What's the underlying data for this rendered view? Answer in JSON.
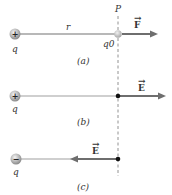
{
  "figure": {
    "point_label": "P",
    "panels": [
      {
        "id": "a",
        "caption": "(a)",
        "source_charge": {
          "sign": "+",
          "label": "q"
        },
        "distance_label": "r",
        "test_charge_label": "q0",
        "vector": {
          "label": "F",
          "arrow": "→",
          "direction": "right"
        }
      },
      {
        "id": "b",
        "caption": "(b)",
        "source_charge": {
          "sign": "+",
          "label": "q"
        },
        "vector": {
          "label": "E",
          "arrow": "→",
          "direction": "right"
        }
      },
      {
        "id": "c",
        "caption": "(c)",
        "source_charge": {
          "sign": "−",
          "label": "q"
        },
        "vector": {
          "label": "E",
          "arrow": "→",
          "direction": "left"
        }
      }
    ]
  },
  "colors": {
    "line": "#9a9a9a",
    "arrow": "#6e6e6e",
    "charge": "#b8b8b8",
    "dashed": "#777777"
  }
}
